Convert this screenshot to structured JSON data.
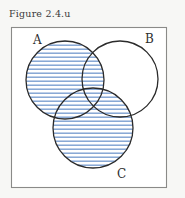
{
  "figure": {
    "caption": "Figure 2.4.u",
    "type": "venn-diagram",
    "set_count": 3
  },
  "universe": {
    "name": "universal-set-rectangle",
    "border_color": "#8a8a88",
    "fill_color": "#ffffff"
  },
  "sets": [
    {
      "id": "A",
      "label": "A",
      "cx": 65,
      "cy": 80,
      "r": 39,
      "label_x": 33,
      "label_y": 44,
      "shaded": true
    },
    {
      "id": "B",
      "label": "B",
      "cx": 120,
      "cy": 79,
      "r": 38,
      "label_x": 145,
      "label_y": 43,
      "shaded": false
    },
    {
      "id": "C",
      "label": "C",
      "cx": 93,
      "cy": 128,
      "r": 40,
      "label_x": 117,
      "label_y": 178,
      "shaded": true
    }
  ],
  "shading": {
    "description": "A union C",
    "style": "horizontal-hatch",
    "line_color": "#7c9fd1",
    "line_spacing_px": 4,
    "line_width_px": 1.4,
    "background": "#ffffff"
  },
  "regions": [
    {
      "name": "A-only",
      "shaded": true
    },
    {
      "name": "B-only",
      "shaded": false
    },
    {
      "name": "C-only",
      "shaded": true
    },
    {
      "name": "A-intersect-B",
      "shaded": true
    },
    {
      "name": "A-intersect-C",
      "shaded": true
    },
    {
      "name": "B-intersect-C",
      "shaded": true
    },
    {
      "name": "A-intersect-B-intersect-C",
      "shaded": true
    },
    {
      "name": "outside-all-sets",
      "shaded": false
    }
  ],
  "colors": {
    "hatch_blue": "#7c9fd1",
    "outline_dark": "#2b2b2b",
    "box_border": "#8a8a88",
    "caption_text": "#3b3b3b",
    "page_background": "#f7f7f5"
  }
}
